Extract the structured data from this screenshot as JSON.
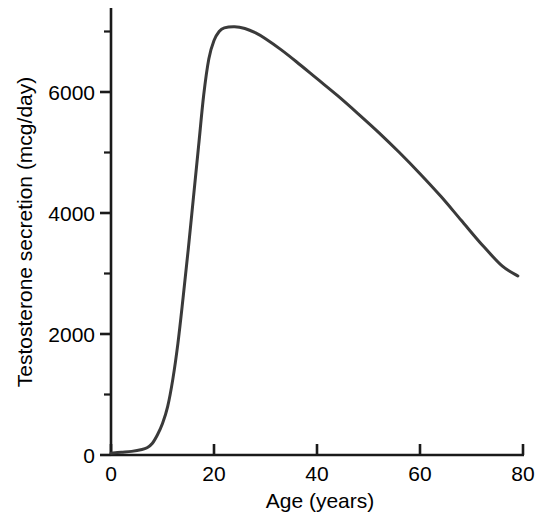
{
  "chart_data": {
    "type": "line",
    "title": "",
    "subtitle": "",
    "xlabel": "Age (years)",
    "ylabel": "Testosterone secretion (mcg/day)",
    "xlim": [
      0,
      80
    ],
    "ylim": [
      0,
      7200
    ],
    "xticks": [
      0,
      20,
      40,
      60,
      80
    ],
    "xtick_labels": [
      "0",
      "20",
      "40",
      "60",
      "80"
    ],
    "xticks_minor": [
      10,
      30,
      50,
      70
    ],
    "yticks": [
      0,
      2000,
      4000,
      6000
    ],
    "ytick_labels": [
      "0",
      "2000",
      "4000",
      "6000"
    ],
    "yticks_minor": [
      1000,
      3000,
      5000,
      7000
    ],
    "grid": false,
    "legend": "none",
    "line_color": "#3a3a3a",
    "line_width": 3,
    "axis_color": "#1a1a1a",
    "series": [
      {
        "name": "Testosterone secretion",
        "x": [
          0,
          2,
          4,
          6,
          7,
          8,
          9,
          10,
          11,
          12,
          13,
          14,
          15,
          16,
          17,
          18,
          19,
          20,
          21,
          22,
          24,
          26,
          28,
          30,
          33,
          36,
          40,
          44,
          48,
          52,
          56,
          60,
          64,
          68,
          72,
          76,
          79
        ],
        "y": [
          30,
          45,
          60,
          90,
          120,
          190,
          330,
          520,
          800,
          1250,
          1850,
          2600,
          3400,
          4250,
          5100,
          5950,
          6550,
          6850,
          7000,
          7060,
          7080,
          7050,
          6980,
          6880,
          6700,
          6500,
          6220,
          5940,
          5640,
          5330,
          5000,
          4650,
          4280,
          3880,
          3480,
          3120,
          2960
        ]
      }
    ]
  },
  "axis_titles": {
    "x": "Age (years)",
    "y": "Testosterone secretion (mcg/day)"
  }
}
